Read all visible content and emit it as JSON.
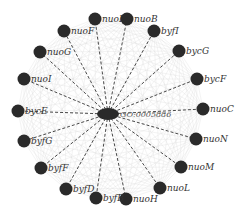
{
  "diagram": {
    "type": "network",
    "center": {
      "id": "GO:0005886",
      "label": "GO:0005886",
      "x": 108,
      "y": 114,
      "rx": 11,
      "ry": 6
    },
    "nodes": [
      {
        "label": "nuoE",
        "x": 95,
        "y": 19
      },
      {
        "label": "nuoB",
        "x": 127,
        "y": 19
      },
      {
        "label": "byfI",
        "x": 154,
        "y": 31
      },
      {
        "label": "bycG",
        "x": 179,
        "y": 51
      },
      {
        "label": "bycF",
        "x": 197,
        "y": 79
      },
      {
        "label": "nuoC",
        "x": 203,
        "y": 109
      },
      {
        "label": "nuoN",
        "x": 196,
        "y": 139
      },
      {
        "label": "nuoM",
        "x": 181,
        "y": 167
      },
      {
        "label": "nuoL",
        "x": 160,
        "y": 188
      },
      {
        "label": "nuoH",
        "x": 126,
        "y": 199
      },
      {
        "label": "byfB",
        "x": 96,
        "y": 198
      },
      {
        "label": "byfD",
        "x": 66,
        "y": 189
      },
      {
        "label": "byfF",
        "x": 41,
        "y": 168
      },
      {
        "label": "byfG",
        "x": 24,
        "y": 141
      },
      {
        "label": "bycE",
        "x": 18,
        "y": 111
      },
      {
        "label": "nuoI",
        "x": 24,
        "y": 79
      },
      {
        "label": "nuoG",
        "x": 40,
        "y": 52
      },
      {
        "label": "nuoF",
        "x": 64,
        "y": 31
      }
    ],
    "colors": {
      "node": "#2a2a2a",
      "spoke_edge": "#333333",
      "mesh_edge": "#dddddd",
      "label": "#333333"
    },
    "node_radius": 6.5
  }
}
